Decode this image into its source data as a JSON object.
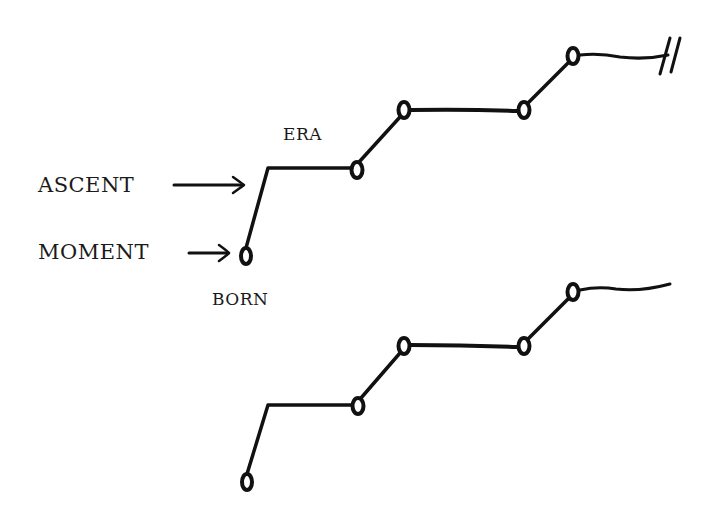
{
  "diagram": {
    "labels": {
      "ascent": "ASCENT",
      "moment": "MOMENT",
      "era": "ERA",
      "born": "BORN"
    },
    "top_path": {
      "nodes": [
        [
          246,
          255
        ],
        [
          357,
          170
        ],
        [
          404,
          110
        ],
        [
          524,
          110
        ],
        [
          573,
          56
        ]
      ],
      "end_mark": "double-slash-break"
    },
    "bottom_path": {
      "nodes": [
        [
          247,
          482
        ],
        [
          358,
          406
        ],
        [
          404,
          346
        ],
        [
          524,
          346
        ],
        [
          573,
          292
        ]
      ],
      "end_mark": "none"
    },
    "stroke_color": "#111111"
  }
}
